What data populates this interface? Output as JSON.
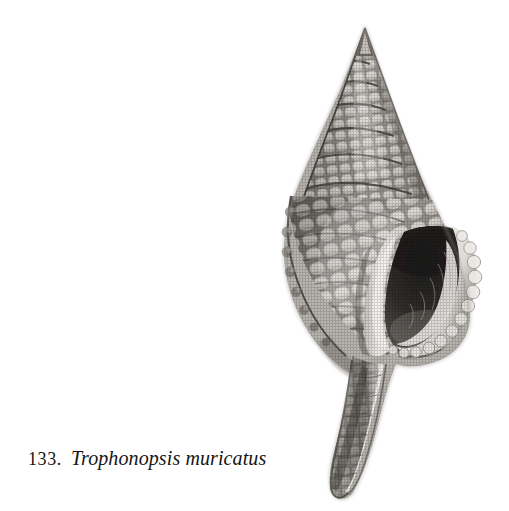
{
  "page": {
    "background_color": "#ffffff",
    "width": 509,
    "height": 511
  },
  "caption": {
    "number": "133.",
    "species": "Trophonopsis muricatus",
    "full_text": "133. Trophonopsis muricatus",
    "text_color": "#141414"
  },
  "figure": {
    "name": "seashell-illustration",
    "subject": "Trophonopsis muricatus",
    "technique": "halftone engraving",
    "orientation": "apertural view, apex up",
    "palette": {
      "paper": "#ffffff",
      "highlight": "#f2f0ec",
      "light_gray": "#d9d6d1",
      "mid_gray": "#a8a49f",
      "shadow_gray": "#6e6a66",
      "dark_gray": "#464340",
      "aperture_dark": "#2b2926",
      "outline": "#3a3734"
    },
    "parts": [
      {
        "name": "apex",
        "label": "Apex"
      },
      {
        "name": "spire",
        "label": "Spire"
      },
      {
        "name": "body-whorl",
        "label": "Body whorl"
      },
      {
        "name": "aperture",
        "label": "Aperture"
      },
      {
        "name": "outer-lip",
        "label": "Outer lip"
      },
      {
        "name": "columella",
        "label": "Columella"
      },
      {
        "name": "siphonal-canal",
        "label": "Siphonal canal"
      }
    ],
    "sculpture": {
      "type": "cancellate",
      "description": "spiral cords crossed by axial ribs forming rows of rounded beads",
      "spiral_rows": 17,
      "axial_ribs": 15
    },
    "outer_lip": {
      "crenulations": 13
    }
  }
}
